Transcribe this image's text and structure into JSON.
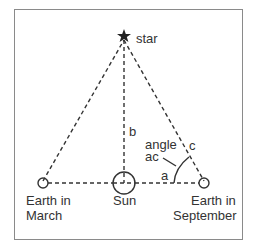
{
  "diagram": {
    "type": "stellar-parallax",
    "colors": {
      "line": "#333333",
      "frame": "#8a8a8a",
      "text": "#333333"
    },
    "star": {
      "label": "star",
      "icon": "star-icon"
    },
    "sun": {
      "label": "Sun"
    },
    "earth_march": {
      "line1": "Earth in",
      "line2": "March"
    },
    "earth_september": {
      "line1": "Earth in",
      "line2": "September"
    },
    "segments": {
      "a": "a",
      "b": "b",
      "c": "c"
    },
    "angle": {
      "line1": "angle",
      "line2": "ac"
    }
  }
}
